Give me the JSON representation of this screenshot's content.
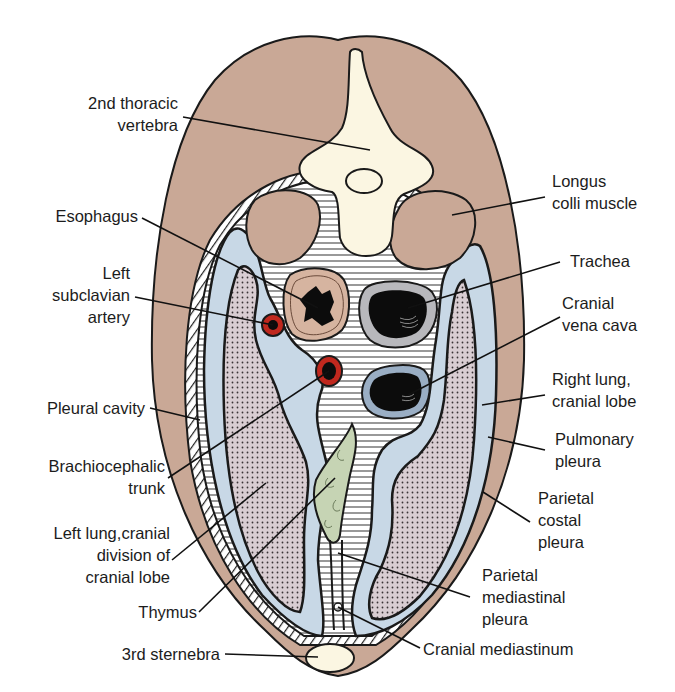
{
  "figure": {
    "colors": {
      "muscle": "#c9a896",
      "bone": "#fbf6e2",
      "pleural_space": "#c8d8e6",
      "lung_fill": "#d8ccd0",
      "mediastinum_bg": "#ffffff",
      "artery": "#c0281e",
      "thymus": "#c6d4b4",
      "outline": "#1a1a1a"
    }
  },
  "labels": {
    "vertebra": "2nd thoracic\nvertebra",
    "longus_colli": "Longus\ncolli muscle",
    "esophagus": "Esophagus",
    "trachea": "Trachea",
    "left_subclavian": "Left\nsubclavian\nartery",
    "vena_cava": "Cranial\nvena cava",
    "right_lung": "Right lung,\ncranial lobe",
    "pleural_cavity": "Pleural cavity",
    "pulmonary_pleura": "Pulmonary\npleura",
    "brachiocephalic": "Brachiocephalic\ntrunk",
    "parietal_costal": "Parietal\ncostal\npleura",
    "left_lung": "Left lung,cranial\ndivision of\ncranial lobe",
    "thymus": "Thymus",
    "parietal_mediastinal": "Parietal\nmediastinal\npleura",
    "sternebra": "3rd sternebra",
    "cranial_mediastinum": "Cranial mediastinum"
  }
}
